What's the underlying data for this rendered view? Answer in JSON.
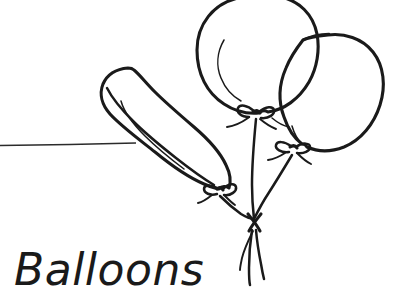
{
  "image": {
    "title": "Balloons",
    "style": "hand-drawn black line art on white background",
    "subject": "bunch of three balloons tied together with strings",
    "background_color": "#ffffff",
    "ink_color": "#1a1a1a",
    "width": 399,
    "height": 294
  },
  "caption": {
    "text": "Balloons",
    "x": 14,
    "y": 285,
    "font_size_px": 44,
    "style": "handwritten italic",
    "color": "#1a1a1a"
  },
  "rule": {
    "name": "horizontal-guide-line",
    "x1": 0,
    "y1": 145,
    "x2": 136,
    "y2": 143,
    "color": "#2b2b2b"
  },
  "balloons": [
    {
      "id": "balloon-left-oblong",
      "shape": "elongated peanut / sausage balloon",
      "orientation": "tilted diagonally from upper-left to lower-right",
      "bounds": {
        "x": 100,
        "y": 66,
        "width": 130,
        "height": 130
      },
      "knot_at": {
        "x": 219,
        "y": 188
      },
      "has_highlight": true
    },
    {
      "id": "balloon-center-round",
      "shape": "large round balloon",
      "orientation": "upright, top edge clipped by frame",
      "bounds": {
        "x": 197,
        "y": -2,
        "width": 124,
        "height": 120
      },
      "knot_at": {
        "x": 256,
        "y": 110
      },
      "has_highlight": true
    },
    {
      "id": "balloon-right-round",
      "shape": "round balloon partially hidden behind the center balloon",
      "orientation": "upright, offset to the right and lower",
      "bounds": {
        "x": 288,
        "y": 38,
        "width": 96,
        "height": 112
      },
      "knot_at": {
        "x": 293,
        "y": 146
      },
      "has_highlight": true
    }
  ],
  "strings": {
    "gather_point": {
      "x": 254,
      "y": 219
    },
    "count": 3,
    "tail_count": 3,
    "tails_end_y": 288
  },
  "bows": {
    "count": 3,
    "description": "small ribbon bow tie at the neck of each balloon"
  }
}
